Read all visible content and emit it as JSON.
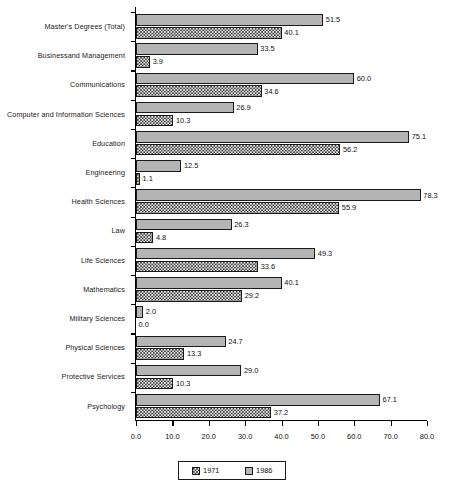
{
  "chart_data": {
    "type": "bar",
    "orientation": "horizontal",
    "title": "",
    "xlabel": "",
    "ylabel": "",
    "xlim": [
      0,
      80
    ],
    "xticks": [
      "0.0",
      "10.0",
      "20.0",
      "30.0",
      "40.0",
      "50.0",
      "60.0",
      "70.0",
      "80.0"
    ],
    "grid": false,
    "legend_position": "bottom",
    "categories": [
      "Master's Degrees (Total)",
      "Businessand Management",
      "Communications",
      "Computer and Information Sciences",
      "Education",
      "Engineering",
      "Health Sciences",
      "Law",
      "Life Sciences",
      "Mathematics",
      "Military Sciences",
      "Physical Sciences",
      "Protective Services",
      "Psychology"
    ],
    "series": [
      {
        "name": "1986",
        "color": "#b4b4b4",
        "values": [
          51.5,
          33.5,
          60.0,
          26.9,
          75.1,
          12.5,
          78.3,
          26.3,
          49.3,
          40.1,
          2.0,
          24.7,
          29.0,
          67.1
        ],
        "labels": [
          "51.5",
          "33.5",
          "60.0",
          "26.9",
          "75.1",
          "12.5",
          "78.3",
          "26.3",
          "49.3",
          "40.1",
          "2.0",
          "24.7",
          "29.0",
          "67.1"
        ]
      },
      {
        "name": "1971",
        "color": "#3a3a3a",
        "values": [
          40.1,
          3.9,
          34.6,
          10.3,
          56.2,
          1.1,
          55.9,
          4.8,
          33.6,
          29.2,
          0.0,
          13.3,
          10.3,
          37.2
        ],
        "labels": [
          "40.1",
          "3.9",
          "34.6",
          "10.3",
          "56.2",
          "1.1",
          "55.9",
          "4.8",
          "33.6",
          "29.2",
          "0.0",
          "13.3",
          "10.3",
          "37.2"
        ]
      }
    ]
  },
  "legend": {
    "entries": [
      {
        "label": "1971",
        "swatch": "checkered-swatch"
      },
      {
        "label": "1986",
        "swatch": "gray-swatch"
      }
    ]
  }
}
